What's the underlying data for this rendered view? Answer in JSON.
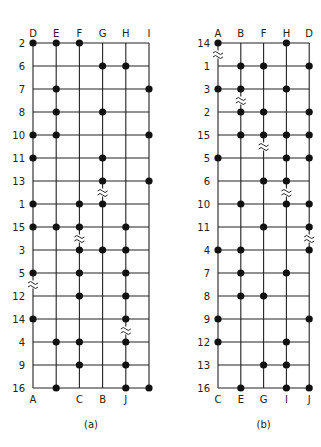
{
  "diagrams": [
    {
      "id": "a",
      "caption": "(a)",
      "x0": 33,
      "dx": 23.2,
      "y0": 43,
      "dy": 23,
      "top_labels": [
        "D",
        "E",
        "F",
        "G",
        "H",
        "I"
      ],
      "bottom_labels": [
        "A",
        "",
        "C",
        "B",
        "J",
        ""
      ],
      "rows": [
        {
          "label": "2",
          "dots": [
            0,
            1,
            2
          ]
        },
        {
          "label": "6",
          "dots": [
            3,
            4
          ]
        },
        {
          "label": "7",
          "dots": [
            1,
            5
          ]
        },
        {
          "label": "8",
          "dots": [
            1,
            3
          ]
        },
        {
          "label": "10",
          "dots": [
            0,
            1,
            5
          ]
        },
        {
          "label": "11",
          "dots": [
            0,
            3
          ]
        },
        {
          "label": "13",
          "dots": [
            3,
            5
          ]
        },
        {
          "label": "1",
          "dots": [
            0,
            2,
            3
          ]
        },
        {
          "label": "15",
          "dots": [
            0,
            1,
            2,
            4
          ]
        },
        {
          "label": "3",
          "dots": [
            2,
            3,
            4
          ]
        },
        {
          "label": "5",
          "dots": [
            0,
            2,
            4
          ]
        },
        {
          "label": "12",
          "dots": [
            2,
            4
          ]
        },
        {
          "label": "14",
          "dots": [
            0,
            4
          ]
        },
        {
          "label": "4",
          "dots": [
            1,
            2,
            4
          ]
        },
        {
          "label": "9",
          "dots": [
            2,
            4
          ]
        },
        {
          "label": "16",
          "dots": [
            1,
            4,
            5
          ]
        }
      ],
      "breaks": [
        {
          "col": 3,
          "after_row": 6
        },
        {
          "col": 2,
          "after_row": 8
        },
        {
          "col": 0,
          "after_row": 10
        },
        {
          "col": 4,
          "after_row": 12
        }
      ]
    },
    {
      "id": "b",
      "caption": "(b)",
      "x0": 218,
      "dx": 22.8,
      "y0": 43,
      "dy": 23,
      "top_labels": [
        "A",
        "B",
        "F",
        "H",
        "D"
      ],
      "bottom_labels": [
        "C",
        "E",
        "G",
        "I",
        "J"
      ],
      "rows": [
        {
          "label": "14",
          "dots": [
            0,
            3
          ]
        },
        {
          "label": "1",
          "dots": [
            1,
            2,
            4
          ]
        },
        {
          "label": "3",
          "dots": [
            0,
            1,
            3
          ]
        },
        {
          "label": "2",
          "dots": [
            1,
            2,
            4
          ]
        },
        {
          "label": "15",
          "dots": [
            1,
            2,
            3,
            4
          ]
        },
        {
          "label": "5",
          "dots": [
            0,
            3,
            4
          ]
        },
        {
          "label": "6",
          "dots": [
            2,
            3
          ]
        },
        {
          "label": "10",
          "dots": [
            1,
            3,
            4
          ]
        },
        {
          "label": "11",
          "dots": [
            2,
            4
          ]
        },
        {
          "label": "4",
          "dots": [
            0,
            1,
            4
          ]
        },
        {
          "label": "7",
          "dots": [
            1,
            3
          ]
        },
        {
          "label": "8",
          "dots": [
            1,
            2
          ]
        },
        {
          "label": "9",
          "dots": [
            0,
            4
          ]
        },
        {
          "label": "12",
          "dots": [
            0,
            3
          ]
        },
        {
          "label": "13",
          "dots": [
            2,
            3
          ]
        },
        {
          "label": "16",
          "dots": [
            1,
            3,
            4
          ]
        }
      ],
      "breaks": [
        {
          "col": 0,
          "after_row": 0
        },
        {
          "col": 1,
          "after_row": 2
        },
        {
          "col": 2,
          "after_row": 4
        },
        {
          "col": 3,
          "after_row": 6
        },
        {
          "col": 4,
          "after_row": 8
        }
      ]
    }
  ],
  "style": {
    "line_color": "#222222",
    "dot_color": "#111111",
    "background": "#ffffff"
  }
}
